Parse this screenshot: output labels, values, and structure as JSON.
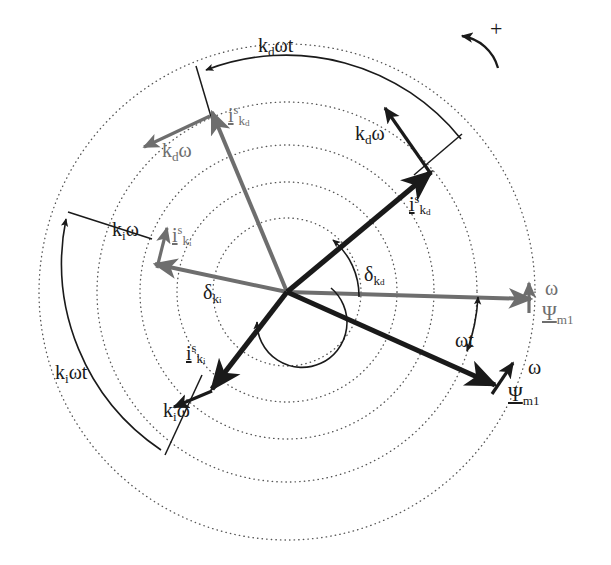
{
  "figure": {
    "type": "phasor-space-vector-diagram",
    "title": "",
    "background": "#ffffff",
    "colors": {
      "primary": "#1a1a1a",
      "secondary": "#6e6e6e",
      "dotted_circle": "#555555"
    },
    "center": {
      "x": 287,
      "y": 292
    },
    "circles": [
      {
        "name": "circle-1-innermost",
        "r": 74
      },
      {
        "name": "circle-2",
        "r": 110
      },
      {
        "name": "circle-3",
        "r": 147
      },
      {
        "name": "circle-4",
        "r": 190
      },
      {
        "name": "circle-5-outermost",
        "r": 248
      }
    ],
    "rotation_indicator": {
      "label": "+",
      "meaning": "positive-rotation-direction"
    },
    "vectors": [
      {
        "name": "psi-m1-black",
        "label": "Ψ",
        "sub": "m1",
        "color": "#1a1a1a",
        "angle_deg": -29,
        "length": 222,
        "style": "bold"
      },
      {
        "name": "psi-m1-gray",
        "label": "Ψ",
        "sub": "m1",
        "color": "#6e6e6e",
        "angle_deg": -4,
        "length": 248,
        "style": "medium"
      },
      {
        "name": "i-kd-black",
        "label": "i",
        "sup": "s",
        "sub": "k_d",
        "color": "#1a1a1a",
        "angle_deg": 49,
        "length": 215,
        "style": "bold"
      },
      {
        "name": "i-kd-gray",
        "label": "i",
        "sup": "s",
        "sub": "k_d",
        "color": "#6e6e6e",
        "angle_deg": 104,
        "length": 215,
        "style": "medium"
      },
      {
        "name": "i-ki-black",
        "label": "i",
        "sup": "s",
        "sub": "k_i",
        "color": "#1a1a1a",
        "angle_deg": -121,
        "length": 160,
        "style": "bold"
      },
      {
        "name": "i-ki-gray",
        "label": "i",
        "sup": "s",
        "sub": "k_i",
        "color": "#6e6e6e",
        "angle_deg": 172,
        "length": 190,
        "style": "medium"
      }
    ],
    "labels": {
      "plus": "+",
      "kd_omega_t": {
        "base": "k",
        "sub": "d",
        "tail": "ωt"
      },
      "ki_omega_t": {
        "base": "k",
        "sub": "i",
        "tail": "ωt"
      },
      "kd_omega_right": {
        "base": "k",
        "sub": "d",
        "tail": "ω"
      },
      "kd_omega_left": {
        "base": "k",
        "sub": "d",
        "tail": "ω"
      },
      "ki_omega_left": {
        "base": "k",
        "sub": "i",
        "tail": "ω"
      },
      "ki_omega_lower": {
        "base": "k",
        "sub": "i",
        "tail": "ω"
      },
      "delta_ki": {
        "base": "δ",
        "sub": "k",
        "subsub": "i"
      },
      "delta_kd": {
        "base": "δ",
        "sub": "k",
        "subsub": "d"
      },
      "omega_t": "ωt",
      "omega_upper": "ω",
      "omega_lower": "ω",
      "psi_upper": {
        "base": "Ψ",
        "sub": "m1"
      },
      "psi_lower": {
        "base": "Ψ",
        "sub": "m1"
      },
      "i_kd_upper_gray": {
        "base": "i",
        "sup": "s",
        "sub": "k",
        "subsub": "d"
      },
      "i_kd_right_black": {
        "base": "i",
        "sup": "s",
        "sub": "k",
        "subsub": "d"
      },
      "i_ki_left_gray": {
        "base": "i",
        "sup": "s",
        "sub": "k",
        "subsub": "i"
      },
      "i_ki_lower_black": {
        "base": "i",
        "sup": "s",
        "sub": "k",
        "subsub": "i"
      }
    }
  }
}
